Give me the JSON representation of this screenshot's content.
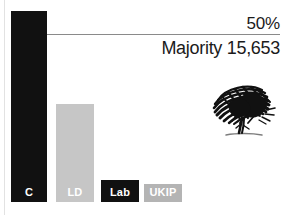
{
  "chart_data": {
    "type": "bar",
    "title": "",
    "xlabel": "",
    "ylabel": "",
    "categories": [
      "C",
      "LD",
      "Lab",
      "UKIP"
    ],
    "values": [
      98,
      50,
      11,
      9
    ],
    "ylim": [
      0,
      100
    ],
    "grid": false,
    "legend_position": "none",
    "bar_colors": [
      "#111111",
      "#c6c6c6",
      "#111111",
      "#b4b4b4"
    ],
    "annotations": [
      {
        "name": "threshold",
        "label": "50%",
        "value": 50,
        "line": true
      },
      {
        "name": "majority",
        "label": "Majority 15,653"
      }
    ]
  },
  "threshold": {
    "label": "50%"
  },
  "majority": {
    "label": "Majority 15,653"
  },
  "bars": [
    {
      "key": "c",
      "label": "C",
      "color": "#111111",
      "label_color": "#ffffff",
      "left": 11,
      "width": 36,
      "top": 11
    },
    {
      "key": "ld",
      "label": "LD",
      "color": "#c6c6c6",
      "label_color": "#ffffff",
      "left": 56,
      "width": 38,
      "top": 104
    },
    {
      "key": "lab",
      "label": "Lab",
      "color": "#111111",
      "label_color": "#ffffff",
      "left": 101,
      "width": 38,
      "top": 180
    },
    {
      "key": "ukip",
      "label": "UKIP",
      "color": "#b4b4b4",
      "label_color": "#ffffff",
      "left": 144,
      "width": 38,
      "top": 184
    }
  ],
  "logo": {
    "name": "oak-tree-logo"
  }
}
